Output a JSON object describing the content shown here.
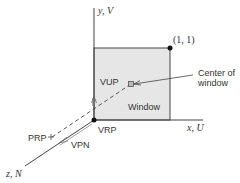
{
  "diagram": {
    "axes": {
      "y": {
        "label": "y, V"
      },
      "x": {
        "label": "x, U"
      },
      "z": {
        "label": "z, N"
      }
    },
    "window": {
      "label": "Window",
      "corner_label": "(1, 1)",
      "fill_color": "#e6e6e6",
      "center_label_line1": "Center of",
      "center_label_line2": "window"
    },
    "points": {
      "vrp": {
        "label": "VRP"
      },
      "prp": {
        "label": "PRP"
      }
    },
    "vectors": {
      "vup": {
        "label": "VUP"
      },
      "vpn": {
        "label": "VPN"
      }
    },
    "colors": {
      "line": "#333333",
      "window_fill": "#e6e6e6",
      "text": "#333333"
    }
  }
}
